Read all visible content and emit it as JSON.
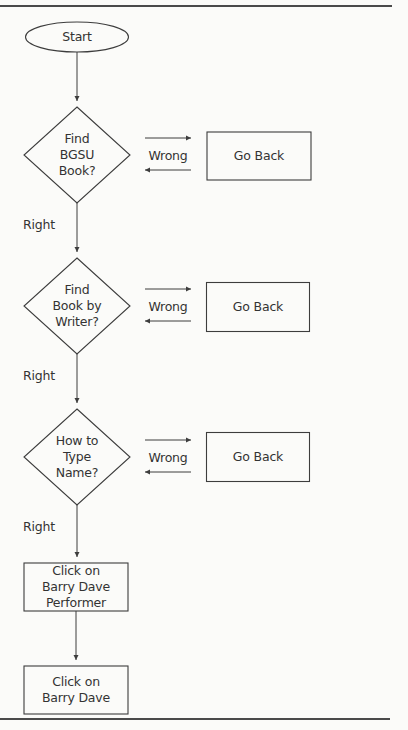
{
  "diagram": {
    "type": "flowchart",
    "colors": {
      "background": "#fbfbf9",
      "line": "#3d3d3d",
      "text": "#333333"
    },
    "nodes": [
      {
        "id": "start",
        "shape": "ellipse",
        "lines": [
          "Start"
        ]
      },
      {
        "id": "q1",
        "shape": "diamond",
        "lines": [
          "Find",
          "BGSU",
          "Book?"
        ]
      },
      {
        "id": "back1",
        "shape": "rect",
        "lines": [
          "Go Back"
        ]
      },
      {
        "id": "q2",
        "shape": "diamond",
        "lines": [
          "Find",
          "Book by",
          "Writer?"
        ]
      },
      {
        "id": "back2",
        "shape": "rect",
        "lines": [
          "Go Back"
        ]
      },
      {
        "id": "q3",
        "shape": "diamond",
        "lines": [
          "How to",
          "Type",
          "Name?"
        ]
      },
      {
        "id": "back3",
        "shape": "rect",
        "lines": [
          "Go Back"
        ]
      },
      {
        "id": "step4",
        "shape": "rect",
        "lines": [
          "Click on",
          "Barry Dave",
          "Performer"
        ]
      },
      {
        "id": "step5",
        "shape": "rect",
        "lines": [
          "Click on",
          "Barry Dave"
        ]
      }
    ],
    "edges": [
      {
        "from": "start",
        "to": "q1",
        "label": ""
      },
      {
        "from": "q1",
        "to": "back1",
        "label": "Wrong"
      },
      {
        "from": "back1",
        "to": "q1",
        "label": ""
      },
      {
        "from": "q1",
        "to": "q2",
        "label": "Right"
      },
      {
        "from": "q2",
        "to": "back2",
        "label": "Wrong"
      },
      {
        "from": "back2",
        "to": "q2",
        "label": ""
      },
      {
        "from": "q2",
        "to": "q3",
        "label": "Right"
      },
      {
        "from": "q3",
        "to": "back3",
        "label": "Wrong"
      },
      {
        "from": "back3",
        "to": "q3",
        "label": ""
      },
      {
        "from": "q3",
        "to": "step4",
        "label": "Right"
      },
      {
        "from": "step4",
        "to": "step5",
        "label": ""
      }
    ]
  }
}
